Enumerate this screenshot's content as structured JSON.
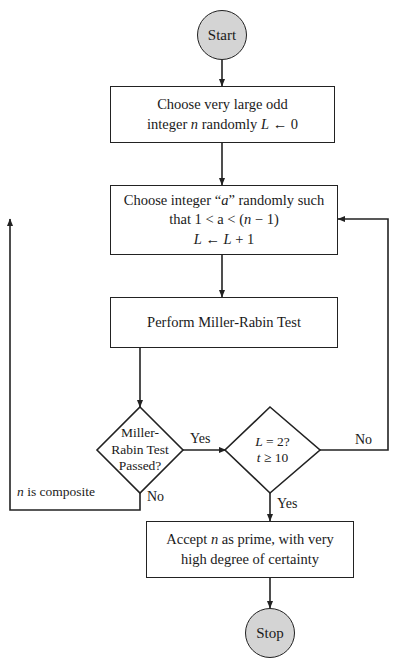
{
  "diagram": {
    "type": "flowchart",
    "background_color": "#ffffff",
    "line_color": "#222222",
    "terminal_fill": "#d4d4d4",
    "process_fill": "#ffffff"
  },
  "nodes": {
    "start": {
      "label": "Start",
      "shape": "terminal"
    },
    "choose_n": {
      "shape": "process",
      "line1": "Choose very large odd",
      "line2_pre": "integer ",
      "line2_var": "n",
      "line2_mid": " randomly ",
      "line2_var2": "L",
      "line2_post": " ← 0"
    },
    "choose_a": {
      "shape": "process",
      "line1_pre": "Choose integer “",
      "line1_var": "a",
      "line1_post": "” randomly such",
      "line2_pre": "that 1 < a < (",
      "line2_var": "n",
      "line2_post": " − 1)",
      "line3_var": "L",
      "line3_mid": " ← ",
      "line3_var2": "L",
      "line3_post": " + 1"
    },
    "perform_test": {
      "shape": "process",
      "label": "Perform Miller-Rabin Test"
    },
    "decision_passed": {
      "shape": "diamond",
      "line1": "Miller-",
      "line2": "Rabin Test",
      "line3": "Passed?"
    },
    "decision_count": {
      "shape": "diamond",
      "line1_var": "L",
      "line1_post": " = 2?",
      "line2_var": "t",
      "line2_post": " ≥ 10"
    },
    "accept": {
      "shape": "process",
      "line1_pre": "Accept ",
      "line1_var": "n",
      "line1_post": " as prime, with very",
      "line2": "high degree of certainty"
    },
    "stop": {
      "label": "Stop",
      "shape": "terminal"
    }
  },
  "edge_labels": {
    "passed_yes": "Yes",
    "passed_no": "No",
    "count_no": "No",
    "count_yes": "Yes",
    "composite_var": "n",
    "composite_text": " is composite"
  }
}
